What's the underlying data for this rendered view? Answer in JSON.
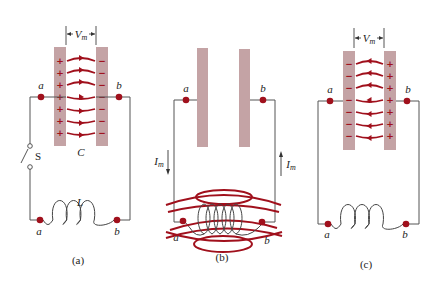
{
  "panels": [
    {
      "id": "a",
      "caption": "(a)",
      "voltage_label": "V",
      "voltage_sub": "m",
      "node_left": "a",
      "node_right": "b",
      "capacitor_label": "C",
      "switch_label": "S",
      "inductor_label": "L",
      "left_plate_sign": "+",
      "right_plate_sign": "−",
      "field_direction": "right"
    },
    {
      "id": "b",
      "caption": "(b)",
      "node_left": "a",
      "node_right": "b",
      "current_label": "I",
      "current_sub": "m"
    },
    {
      "id": "c",
      "caption": "(c)",
      "voltage_label": "V",
      "voltage_sub": "m",
      "node_left": "a",
      "node_right": "b",
      "left_plate_sign": "−",
      "right_plate_sign": "+",
      "field_direction": "left"
    }
  ],
  "colors": {
    "accent": "#a0101c",
    "plate": "#c4a3a5",
    "wire": "#555555"
  }
}
